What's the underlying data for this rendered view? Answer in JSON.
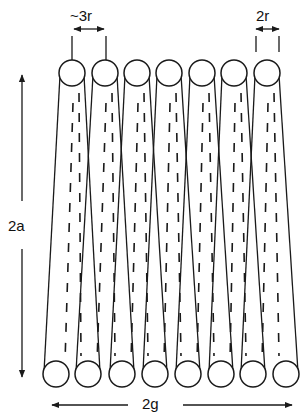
{
  "diagram": {
    "type": "helical-coil-schematic",
    "stroke_color": "#1a1a1a",
    "background": "#ffffff",
    "top_turns": 7,
    "bottom_turns": 8,
    "wire_radius_px": 13,
    "top_circles": {
      "y": 73,
      "x": [
        72,
        105,
        137,
        169,
        202,
        234,
        267
      ]
    },
    "bottom_circles": {
      "y": 374,
      "x": [
        56,
        88,
        122,
        155,
        188,
        221,
        253,
        286
      ]
    }
  },
  "labels": {
    "pitch": "~3r",
    "diameter": "2r",
    "height": "2a",
    "width": "2g"
  },
  "dimensions": [
    {
      "id": "pitch",
      "label": "~3r",
      "orientation": "horizontal",
      "meaning": "spacing between adjacent turns"
    },
    {
      "id": "wire-diameter",
      "label": "2r",
      "orientation": "horizontal",
      "meaning": "wire diameter"
    },
    {
      "id": "coil-height",
      "label": "2a",
      "orientation": "vertical",
      "meaning": "height of coil"
    },
    {
      "id": "coil-width",
      "label": "2g",
      "orientation": "horizontal",
      "meaning": "overall width of coil"
    }
  ]
}
